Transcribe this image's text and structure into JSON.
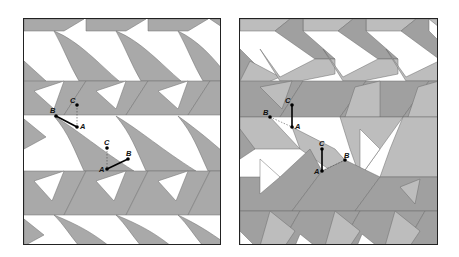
{
  "figure": {
    "panels": [
      {
        "id": "left",
        "description": "Chevron tiling with two-tone shading (white and gray)",
        "colors": {
          "fill_dark": "#a9a9a9",
          "fill_light": "#ffffff",
          "border": "#222222"
        },
        "points": [
          {
            "label": "B",
            "x": 32,
            "y": 97
          },
          {
            "label": "C",
            "x": 53,
            "y": 86
          },
          {
            "label": "A",
            "x": 53,
            "y": 108
          },
          {
            "label": "C",
            "x": 83,
            "y": 129
          },
          {
            "label": "B",
            "x": 104,
            "y": 140
          },
          {
            "label": "A",
            "x": 83,
            "y": 150
          }
        ],
        "labels": [
          "B",
          "C",
          "A",
          "C",
          "B",
          "A"
        ]
      },
      {
        "id": "right",
        "description": "Chevron tiling with three-tone shading",
        "colors": {
          "fill_dark": "#a0a0a0",
          "fill_mid": "#bdbdbd",
          "fill_light": "#ffffff",
          "border": "#222222"
        },
        "points": [
          {
            "label": "B",
            "x": 30,
            "y": 98
          },
          {
            "label": "C",
            "x": 52,
            "y": 86
          },
          {
            "label": "A",
            "x": 52,
            "y": 108
          },
          {
            "label": "C",
            "x": 82,
            "y": 130
          },
          {
            "label": "B",
            "x": 105,
            "y": 141
          },
          {
            "label": "A",
            "x": 82,
            "y": 152
          }
        ],
        "labels": [
          "B",
          "C",
          "A",
          "C",
          "B",
          "A"
        ]
      }
    ]
  }
}
